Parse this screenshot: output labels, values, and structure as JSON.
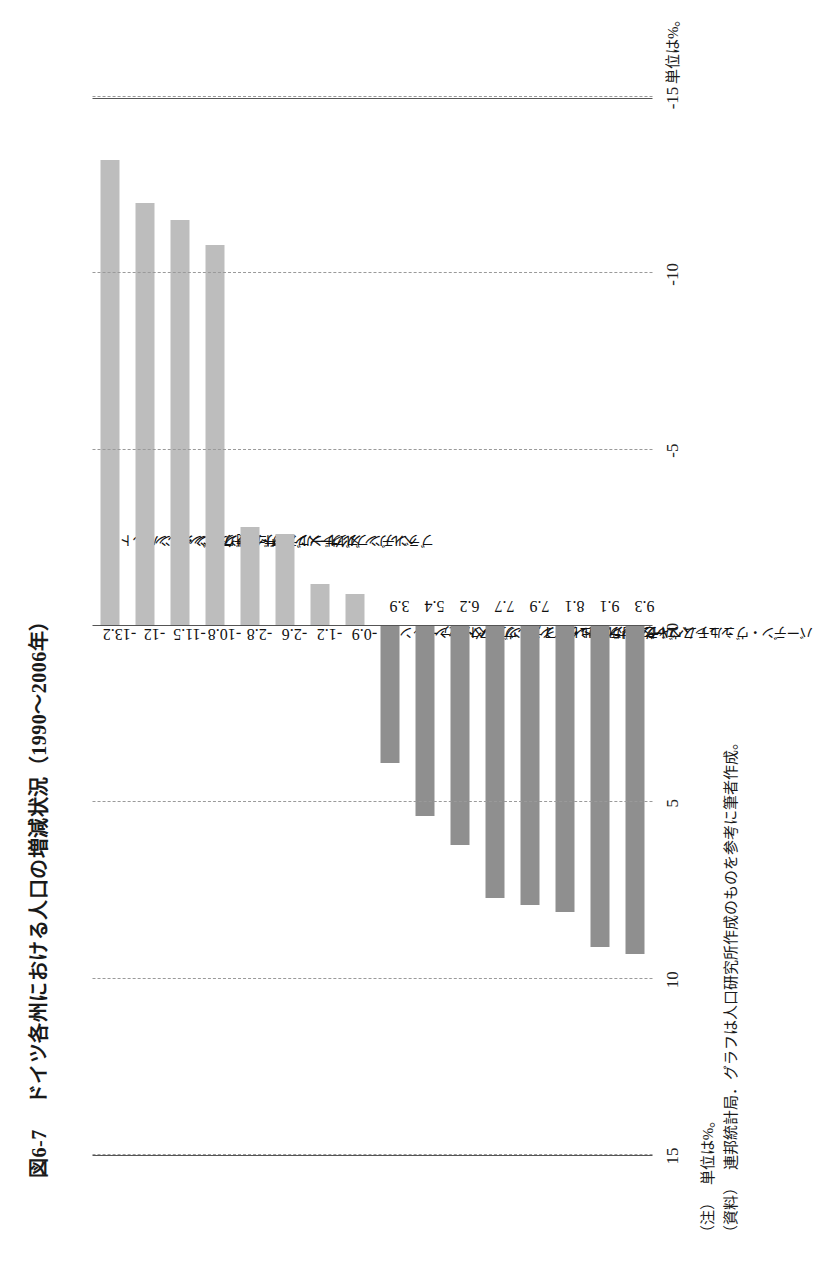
{
  "figure": {
    "number": "図6-7",
    "title": "ドイツ各州における人口の増減状況（1990～2006年）",
    "unit_note_tag": "（注）",
    "unit_note": "単位は%。",
    "source_tag": "（資料）",
    "source": "連邦統計局．グラフは人口研究所作成のものを参考に筆者作成。"
  },
  "chart_data": {
    "type": "bar",
    "title": "ドイツ各州における人口の増減状況（1990～2006年）",
    "xlabel": "",
    "ylabel": "",
    "unit": "%",
    "orientation": "vertical-on-rotated-page",
    "ylim": [
      -15,
      15
    ],
    "yticks": [
      -15,
      -10,
      -5,
      0,
      5,
      10,
      15
    ],
    "ytick_labels": [
      "-15",
      "-10",
      "-5",
      "0",
      "5",
      "10",
      "15"
    ],
    "grid": true,
    "legend": "none",
    "categories": [
      "ザクセン・アンハルト",
      "メクレンブルク・フォアポンメルン",
      "チューリンゲン",
      "ザクセン",
      "ザールラント",
      "ブレーメン",
      "ブランデンブルク",
      "ベルリン",
      "ノルドライン・ヴェストファーレン",
      "ヘッセン",
      "ハンブルク",
      "ラインラント・プファルツ",
      "シュレスヴィヒ・ホルシュタイン",
      "ニーダーザクセン",
      "バイエルン",
      "バーデン・ヴュルテムベルク"
    ],
    "values": [
      -13.2,
      -12,
      -11.5,
      -10.8,
      -2.8,
      -2.6,
      -1.2,
      -0.9,
      3.9,
      5.4,
      6.2,
      7.7,
      7.9,
      8.1,
      9.1,
      9.3
    ],
    "value_labels": [
      "-13.2",
      "-12",
      "-11.5",
      "-10.8",
      "-2.8",
      "-2.6",
      "-1.2",
      "-0.9",
      "3.9",
      "5.4",
      "6.2",
      "7.7",
      "7.9",
      "8.1",
      "9.1",
      "9.3"
    ],
    "colors": {
      "negative": "#bdbdbd",
      "positive": "#8f8f8f",
      "axis": "#555555",
      "grid": "#9a9a9a"
    }
  }
}
